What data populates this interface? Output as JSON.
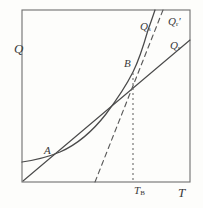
{
  "figure": {
    "type": "line-diagram",
    "frame": {
      "x0": 22,
      "y0": 10,
      "x1": 190,
      "y1": 182
    },
    "ink_color": "#4a4a4a",
    "paper_color": "#fdfdfb",
    "axis_labels": {
      "y": "Q",
      "x": "T"
    },
    "tick_labels": {
      "x_tick_b": {
        "text": "T",
        "sub": "B",
        "x": 143
      }
    },
    "points": [
      {
        "name": "A",
        "label": "A",
        "x": 52,
        "y": 157
      },
      {
        "name": "B",
        "label": "B",
        "x": 133,
        "y": 72
      }
    ],
    "curve_labels": [
      {
        "name": "Qs",
        "base": "Q",
        "sub": "s",
        "prime": ""
      },
      {
        "name": "Qr_prime",
        "base": "Q",
        "sub": "r",
        "prime": "′"
      },
      {
        "name": "Qr",
        "base": "Q",
        "sub": "r",
        "prime": ""
      }
    ],
    "curves": [
      {
        "name": "heat-generation-curve",
        "label": "Qs",
        "style": "solid",
        "path": "M 22 162 C 36 160 48 157 60 152 C 76 145 92 132 106 114 C 118 98 126 86 133 72 C 139 60 144 44 148 30 C 151 22 153 16 155 10"
      },
      {
        "name": "heat-removal-line",
        "label": "Qr",
        "style": "solid",
        "path": "M 23 181 L 190 40"
      },
      {
        "name": "heat-removal-line-tangent",
        "label": "Qr_prime",
        "style": "dashed",
        "path": "M 95 182 L 163 10"
      },
      {
        "name": "ignition-temperature-dropline",
        "label": "T_B",
        "style": "dotted",
        "path": "M 133 72 L 133 182"
      }
    ]
  }
}
